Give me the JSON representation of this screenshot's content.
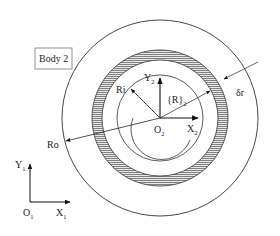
{
  "diagram": {
    "body_label": "Body 2",
    "labels": {
      "ri": "Ri",
      "ro": "Ro",
      "delta_r": "δr",
      "frame2": {
        "main": "{R}",
        "sub": "2"
      },
      "y2": {
        "main": "Y",
        "sub": "2"
      },
      "x2": {
        "main": "X",
        "sub": "2"
      },
      "o2": {
        "main": "O",
        "sub": "2"
      },
      "y1": {
        "main": "Y",
        "sub": "1"
      },
      "x1": {
        "main": "X",
        "sub": "1"
      },
      "o1": {
        "main": "O",
        "sub": "1"
      }
    },
    "colors": {
      "stroke": "#222222",
      "hatch": "#555555",
      "box_border": "#777777"
    }
  }
}
